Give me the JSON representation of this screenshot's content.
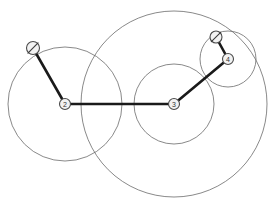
{
  "diagram": {
    "canvas": {
      "width": 272,
      "height": 204,
      "background": "#ffffff"
    },
    "colors": {
      "circle_stroke": "#6b6b6b",
      "edge_stroke": "#1a1a1a",
      "node_fill": "#f2f2f2",
      "node_stroke": "#4a4a4a",
      "label_color": "#333333"
    },
    "nodes": [
      {
        "id": "n1",
        "label": "",
        "x": 33,
        "y": 48,
        "r": 6.5,
        "style": "slashed",
        "name": "node-source-left"
      },
      {
        "id": "n2",
        "label": "2",
        "x": 65,
        "y": 104,
        "r": 5.5,
        "style": "numbered",
        "name": "node-2"
      },
      {
        "id": "n3",
        "label": "3",
        "x": 174,
        "y": 104,
        "r": 5.5,
        "style": "numbered",
        "name": "node-3"
      },
      {
        "id": "n4",
        "label": "4",
        "x": 228,
        "y": 59,
        "r": 5.5,
        "style": "numbered",
        "name": "node-4"
      },
      {
        "id": "n5",
        "label": "",
        "x": 216,
        "y": 37,
        "r": 6.0,
        "style": "slashed",
        "name": "node-sink-right"
      }
    ],
    "edges": [
      {
        "from": "n1",
        "to": "n2",
        "name": "edge-1-2"
      },
      {
        "from": "n2",
        "to": "n3",
        "name": "edge-2-3"
      },
      {
        "from": "n3",
        "to": "n4",
        "name": "edge-3-4"
      },
      {
        "from": "n4",
        "to": "n5",
        "name": "edge-4-5"
      }
    ],
    "range_circles": [
      {
        "cx": 65,
        "cy": 104,
        "r": 57,
        "name": "range-circle-node-2"
      },
      {
        "cx": 174,
        "cy": 104,
        "r": 93,
        "name": "range-circle-node-3-outer"
      },
      {
        "cx": 174,
        "cy": 104,
        "r": 40,
        "name": "range-circle-node-3-inner"
      },
      {
        "cx": 228,
        "cy": 59,
        "r": 28,
        "name": "range-circle-node-4"
      }
    ]
  }
}
